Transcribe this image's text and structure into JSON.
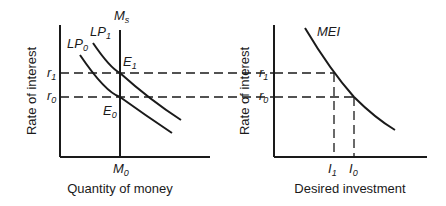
{
  "left_panel": {
    "y_axis_label": "Rate of interest",
    "x_axis_label": "Quantity of money",
    "supply_label": "M",
    "supply_sub": "s",
    "curve0_label": "LP",
    "curve0_sub": "0",
    "curve1_label": "LP",
    "curve1_sub": "1",
    "eq1_label": "E",
    "eq1_sub": "1",
    "eq0_label": "E",
    "eq0_sub": "0",
    "r1_label": "r",
    "r1_sub": "1",
    "r0_label": "r",
    "r0_sub": "0",
    "m0_label": "M",
    "m0_sub": "0"
  },
  "right_panel": {
    "y_axis_label": "Rate of interest",
    "x_axis_label": "Desired investment",
    "curve_label": "MEI",
    "r1_label": "r",
    "r1_sub": "1",
    "r0_label": "r",
    "r0_sub": "0",
    "i1_label": "I",
    "i1_sub": "1",
    "i0_label": "I",
    "i0_sub": "0"
  },
  "colors": {
    "ink": "#1a1a1a",
    "background": "#ffffff"
  }
}
